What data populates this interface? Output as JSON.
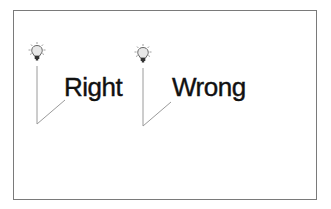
{
  "diagram": {
    "callouts": [
      {
        "label": "Right",
        "icon": "lightbulb-icon"
      },
      {
        "label": "Wrong",
        "icon": "lightbulb-icon"
      }
    ],
    "colors": {
      "border": "#7a7a7a",
      "leader_line": "#9a9a9a",
      "text": "#111111",
      "bulb_fill": "#e8e8e8",
      "bulb_outline": "#555555",
      "bulb_rays": "#888888"
    }
  }
}
